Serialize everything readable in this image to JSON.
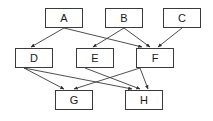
{
  "diagram": {
    "type": "directed-acyclic-graph",
    "title": "",
    "background_color": "#ffffff",
    "node_border_color": "#3a3a3a",
    "node_fill_color": "#ffffff",
    "edge_color": "#3a3a3a",
    "label_color": "#1a1a1a",
    "canvas": {
      "width": 213,
      "height": 121
    },
    "node_size": {
      "width": 38,
      "height": 20
    },
    "ranks": [
      [
        "A",
        "B",
        "C"
      ],
      [
        "D",
        "E",
        "F"
      ],
      [
        "G",
        "H"
      ]
    ],
    "nodes": [
      {
        "id": "A",
        "label": "A",
        "x": 45,
        "y": 8
      },
      {
        "id": "B",
        "label": "B",
        "x": 105,
        "y": 8
      },
      {
        "id": "C",
        "label": "C",
        "x": 163,
        "y": 8
      },
      {
        "id": "D",
        "label": "D",
        "x": 15,
        "y": 48
      },
      {
        "id": "E",
        "label": "E",
        "x": 76,
        "y": 48
      },
      {
        "id": "F",
        "label": "F",
        "x": 136,
        "y": 48
      },
      {
        "id": "G",
        "label": "G",
        "x": 55,
        "y": 90
      },
      {
        "id": "H",
        "label": "H",
        "x": 125,
        "y": 90
      }
    ],
    "edges": [
      {
        "from": "A",
        "to": "D",
        "x1": 64,
        "y1": 28,
        "x2": 31,
        "y2": 47
      },
      {
        "from": "A",
        "to": "F",
        "x1": 64,
        "y1": 28,
        "x2": 142,
        "y2": 47
      },
      {
        "from": "B",
        "to": "E",
        "x1": 124,
        "y1": 28,
        "x2": 93,
        "y2": 47
      },
      {
        "from": "B",
        "to": "F",
        "x1": 124,
        "y1": 28,
        "x2": 150,
        "y2": 47
      },
      {
        "from": "C",
        "to": "F",
        "x1": 182,
        "y1": 28,
        "x2": 158,
        "y2": 47
      },
      {
        "from": "D",
        "to": "G",
        "x1": 24,
        "y1": 68,
        "x2": 64,
        "y2": 89
      },
      {
        "from": "D",
        "to": "H",
        "x1": 24,
        "y1": 68,
        "x2": 132,
        "y2": 89
      },
      {
        "from": "E",
        "to": "H",
        "x1": 85,
        "y1": 68,
        "x2": 140,
        "y2": 89
      },
      {
        "from": "F",
        "to": "G",
        "x1": 140,
        "y1": 68,
        "x2": 74,
        "y2": 89
      },
      {
        "from": "F",
        "to": "H",
        "x1": 140,
        "y1": 68,
        "x2": 148,
        "y2": 89
      }
    ]
  }
}
